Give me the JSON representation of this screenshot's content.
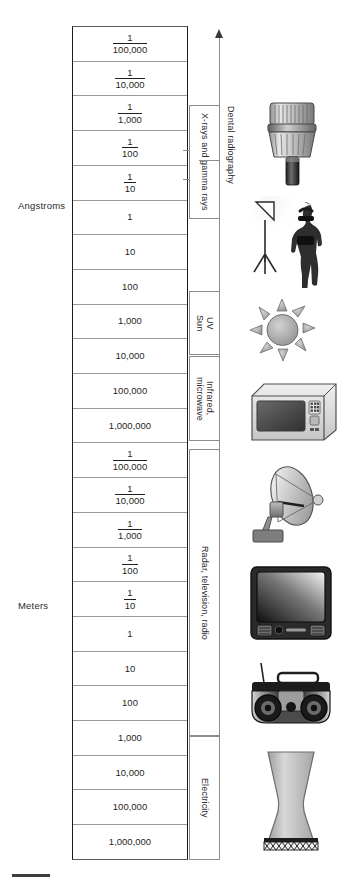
{
  "figure": {
    "type": "electromagnetic-spectrum-scale-diagram",
    "axis_direction_label": "increasing wavelength downward"
  },
  "units": [
    {
      "id": "angstroms",
      "label": "Angstroms"
    },
    {
      "id": "meters",
      "label": "Meters"
    }
  ],
  "scale_rows": [
    {
      "unit": "Angstroms",
      "type": "fraction",
      "num": "1",
      "den": "100,000",
      "text": "1/100,000"
    },
    {
      "unit": "Angstroms",
      "type": "fraction",
      "num": "1",
      "den": "10,000",
      "text": "1/10,000"
    },
    {
      "unit": "Angstroms",
      "type": "fraction",
      "num": "1",
      "den": "1,000",
      "text": "1/1,000"
    },
    {
      "unit": "Angstroms",
      "type": "fraction",
      "num": "1",
      "den": "100",
      "text": "1/100"
    },
    {
      "unit": "Angstroms",
      "type": "fraction",
      "num": "1",
      "den": "10",
      "text": "1/10"
    },
    {
      "unit": "Angstroms",
      "type": "whole",
      "text": "1"
    },
    {
      "unit": "Angstroms",
      "type": "whole",
      "text": "10"
    },
    {
      "unit": "Angstroms",
      "type": "whole",
      "text": "100"
    },
    {
      "unit": "Angstroms",
      "type": "whole",
      "text": "1,000"
    },
    {
      "unit": "Angstroms",
      "type": "whole",
      "text": "10,000"
    },
    {
      "unit": "Angstroms",
      "type": "whole",
      "text": "100,000"
    },
    {
      "unit": "Angstroms",
      "type": "whole",
      "text": "1,000,000"
    },
    {
      "unit": "Meters",
      "type": "fraction",
      "num": "1",
      "den": "100,000",
      "text": "1/100,000"
    },
    {
      "unit": "Meters",
      "type": "fraction",
      "num": "1",
      "den": "10,000",
      "text": "1/10,000"
    },
    {
      "unit": "Meters",
      "type": "fraction",
      "num": "1",
      "den": "1,000",
      "text": "1/1,000"
    },
    {
      "unit": "Meters",
      "type": "fraction",
      "num": "1",
      "den": "100",
      "text": "1/100"
    },
    {
      "unit": "Meters",
      "type": "fraction",
      "num": "1",
      "den": "10",
      "text": "1/10"
    },
    {
      "unit": "Meters",
      "type": "whole",
      "text": "1"
    },
    {
      "unit": "Meters",
      "type": "whole",
      "text": "10"
    },
    {
      "unit": "Meters",
      "type": "whole",
      "text": "100"
    },
    {
      "unit": "Meters",
      "type": "whole",
      "text": "1,000"
    },
    {
      "unit": "Meters",
      "type": "whole",
      "text": "10,000"
    },
    {
      "unit": "Meters",
      "type": "whole",
      "text": "100,000"
    },
    {
      "unit": "Meters",
      "type": "whole",
      "text": "1,000,000"
    }
  ],
  "bands": [
    {
      "id": "xray-gamma",
      "label": "X-rays and gamma rays",
      "top": 105,
      "height": 114
    },
    {
      "id": "uv-sun",
      "label": "UV\nSun",
      "top": 291,
      "height": 64
    },
    {
      "id": "infrared-microwave",
      "label": "Infrared,\nmicrowave",
      "top": 356,
      "height": 85
    },
    {
      "id": "radar-tv-radio",
      "label": "Radar, television, radio",
      "top": 449,
      "height": 287
    },
    {
      "id": "electricity",
      "label": "Electricity",
      "top": 736,
      "height": 124
    }
  ],
  "applications": [
    {
      "id": "dental-radiography",
      "label": "Dental radiography",
      "tick_y": 160,
      "label_top": 106
    }
  ],
  "illustrations": [
    {
      "id": "xray-tube-head",
      "name": "dental-x-ray-tubehead-illustration",
      "top": 95,
      "caption": "Dental x-ray tubehead"
    },
    {
      "id": "photo-studio",
      "name": "studio-light-and-model-illustration",
      "top": 196,
      "caption": "Studio light and model"
    },
    {
      "id": "sun",
      "name": "sun-illustration",
      "top": 298,
      "caption": "Sun"
    },
    {
      "id": "microwave-oven",
      "name": "microwave-oven-illustration",
      "top": 378,
      "caption": "Microwave oven"
    },
    {
      "id": "satellite-dish",
      "name": "satellite-dish-illustration",
      "top": 462,
      "caption": "Satellite dish"
    },
    {
      "id": "television",
      "name": "television-illustration",
      "top": 564,
      "caption": "Television"
    },
    {
      "id": "boombox-radio",
      "name": "boombox-radio-illustration",
      "top": 661,
      "caption": "Boombox radio"
    },
    {
      "id": "cooling-tower",
      "name": "power-plant-cooling-tower-illustration",
      "top": 750,
      "caption": "Power plant cooling tower"
    }
  ],
  "colors": {
    "ink": "#1f1f1f",
    "rule": "#9b9b9b",
    "frame": "#1a1a1a",
    "band_border": "#8d8d8d",
    "illustration_light": "#d9d9d9",
    "illustration_mid": "#9a9a9a",
    "illustration_dark": "#3a3a3a"
  }
}
